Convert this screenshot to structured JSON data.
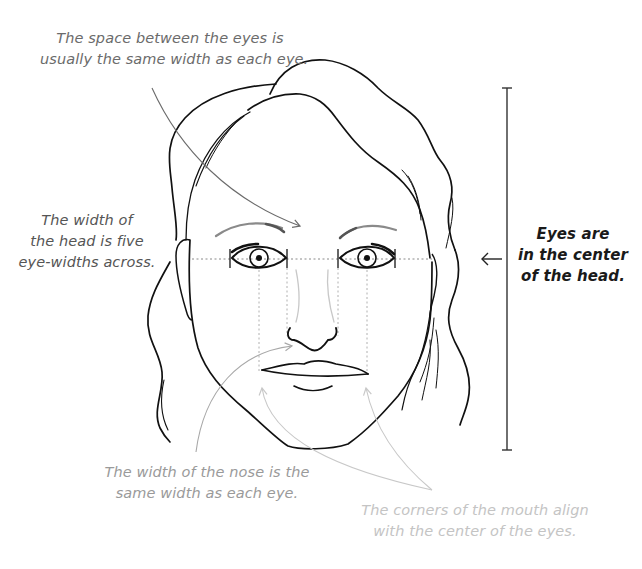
{
  "figure": {
    "colors": {
      "ink": "#111111",
      "guide_dotted": "#9a9a9a",
      "brow_shading": "#8a8a8a",
      "caption_space": "#6b6b6b",
      "caption_headwidth": "#555555",
      "caption_center": "#1a1a1a",
      "caption_nose": "#9a9a9a",
      "caption_mouth": "#c4c4c4",
      "arrow_space": "#6b6b6b",
      "arrow_nose": "#a8a8a8",
      "arrow_mouth": "#c8c8c8"
    }
  },
  "annotations": {
    "eye_spacing": {
      "line1": "The space between the eyes is",
      "line2": "usually the same width as each eye."
    },
    "head_width": {
      "line1": "The width of",
      "line2": "the head is five",
      "line3": "eye-widths across."
    },
    "eye_center": {
      "line1": "Eyes are",
      "line2": "in the center",
      "line3": "of the head."
    },
    "nose_width": {
      "line1": "The width of the nose is the",
      "line2": "same width as each eye."
    },
    "mouth_corners": {
      "line1": "The corners of the mouth align",
      "line2": "with the center of the eyes."
    }
  },
  "guides": {
    "eye_line_y": 259,
    "eye_width_divisions": 5,
    "eye_tick_x": [
      230,
      287,
      338,
      395
    ],
    "head_height_bar": {
      "x": 507,
      "top": 88,
      "bottom": 450
    }
  }
}
